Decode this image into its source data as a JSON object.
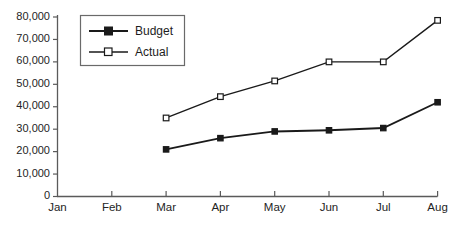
{
  "chart_data": {
    "type": "line",
    "title": "",
    "subtitle": "",
    "xlabel": "",
    "ylabel": "",
    "categories": [
      "Jan",
      "Feb",
      "Mar",
      "Apr",
      "May",
      "Jun",
      "Jul",
      "Aug"
    ],
    "x_tick_labels": [
      "Jan",
      "Feb",
      "Mar",
      "Apr",
      "May",
      "Jun",
      "Jul",
      "Aug"
    ],
    "y_tick_labels": [
      "0",
      "10,000",
      "20,000",
      "30,000",
      "40,000",
      "50,000",
      "60,000",
      "70,000",
      "80,000"
    ],
    "y_tick_values": [
      0,
      10000,
      20000,
      30000,
      40000,
      50000,
      60000,
      70000,
      80000
    ],
    "ylim": [
      0,
      80000
    ],
    "grid": false,
    "legend_position": "top-left-inside",
    "series": [
      {
        "name": "Budget",
        "marker": "filled-square",
        "color": "#1a1a1a",
        "values": [
          null,
          null,
          21000,
          26000,
          29000,
          29500,
          30500,
          42000
        ]
      },
      {
        "name": "Actual",
        "marker": "hollow-square",
        "color": "#1a1a1a",
        "values": [
          null,
          null,
          35000,
          44500,
          51500,
          60000,
          60000,
          78500
        ]
      }
    ],
    "legend": [
      "Budget",
      "Actual"
    ]
  },
  "legend": {
    "budget_label": "Budget",
    "actual_label": "Actual"
  },
  "axes": {
    "y_labels": [
      "80,000",
      "70,000",
      "60,000",
      "50,000",
      "40,000",
      "30,000",
      "20,000",
      "10,000",
      "0"
    ],
    "x_labels": [
      "Jan",
      "Feb",
      "Mar",
      "Apr",
      "May",
      "Jun",
      "Jul",
      "Aug"
    ]
  },
  "colors": {
    "axis": "#5a5a5a",
    "line": "#1a1a1a",
    "text": "#242424",
    "marker_fill_open": "#ffffff",
    "background": "#ffffff"
  }
}
